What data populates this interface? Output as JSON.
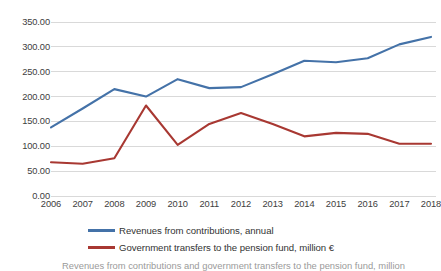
{
  "chart_data": {
    "type": "line",
    "title": "",
    "xlabel": "",
    "ylabel": "",
    "x": [
      2006,
      2007,
      2008,
      2009,
      2010,
      2011,
      2012,
      2013,
      2014,
      2015,
      2016,
      2017,
      2018
    ],
    "categories": [
      "2006",
      "2007",
      "2008",
      "2009",
      "2010",
      "2011",
      "2012",
      "2013",
      "2014",
      "2015",
      "2016",
      "2017",
      "2018"
    ],
    "series": [
      {
        "name": "Revenues from contributions, annual",
        "color": "#4472a8",
        "values": [
          138.0,
          176.0,
          215.0,
          200.0,
          235.0,
          217.0,
          219.0,
          245.0,
          272.0,
          269.0,
          277.0,
          305.0,
          320.0
        ]
      },
      {
        "name": "Government transfers to the pension fund, million €",
        "color": "#a83832",
        "values": [
          68.0,
          65.0,
          76.0,
          182.0,
          103.0,
          145.0,
          167.0,
          145.0,
          120.0,
          127.0,
          125.0,
          105.0,
          105.0
        ]
      }
    ],
    "ylim": [
      0,
      350
    ],
    "ytick_values": [
      0,
      50,
      100,
      150,
      200,
      250,
      300,
      350
    ],
    "ytick_labels": [
      "0.00",
      "50.00",
      "100.00",
      "150.00",
      "200.00",
      "250.00",
      "300.00",
      "350.00"
    ],
    "grid": true,
    "grid_color": "#d9d9d9",
    "legend_position": "bottom"
  },
  "legend": {
    "items": [
      {
        "label": "Revenues from contributions, annual",
        "color": "#4472a8"
      },
      {
        "label": "Government transfers to the pension fund, million €",
        "color": "#a83832"
      }
    ]
  },
  "caption": {
    "text": "Revenues from contributions and government transfers to the pension fund, million"
  }
}
